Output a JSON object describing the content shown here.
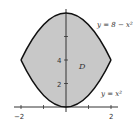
{
  "diagram": {
    "region_label": "D",
    "upper_curve": {
      "label": "y = 8 − x²",
      "equation": "y = 8 - x^2"
    },
    "lower_curve": {
      "label": "y = x²",
      "equation": "y = x^2"
    },
    "x_ticks": [
      "−2",
      "2"
    ],
    "y_ticks": [
      "2",
      "4"
    ],
    "colors": {
      "fill": "#c8c8c8",
      "curve": "#111111",
      "axis": "#333333",
      "background": "#ffffff"
    }
  }
}
